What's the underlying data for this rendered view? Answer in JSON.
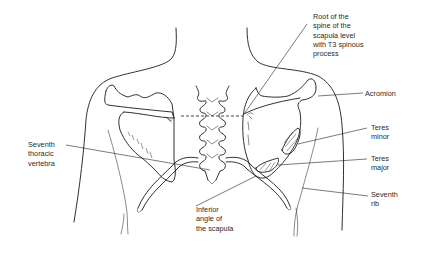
{
  "figure": {
    "line_color": "#1a1a1a",
    "background": "#ffffff"
  },
  "labels": {
    "root_of_spine": {
      "lines": [
        "Root of the",
        "spine of the",
        "scapula level",
        "with T3 spinous",
        "process"
      ]
    },
    "acromion": {
      "lines": [
        "Acromion"
      ]
    },
    "teres_minor": {
      "lines": [
        "Teres",
        "minor"
      ]
    },
    "teres_major": {
      "lines": [
        "Teres",
        "major"
      ]
    },
    "seventh_rib": {
      "lines": [
        "Seventh",
        "rib"
      ]
    },
    "seventh_thoracic_vertebra": {
      "lines": [
        "Seventh",
        "thoracic",
        "vertebra"
      ]
    },
    "inferior_angle": {
      "lines": [
        "Inferior",
        "angle of",
        "the scapula"
      ]
    }
  }
}
